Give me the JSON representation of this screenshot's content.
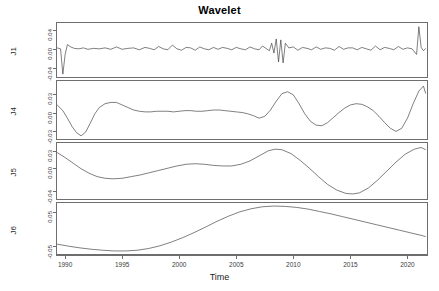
{
  "chart_data": {
    "type": "line",
    "title": "Wavelet",
    "xlabel": "Time",
    "ylabel": "",
    "grid": false,
    "legend": "none",
    "layout": "4 stacked panels sharing one time axis",
    "xlim": [
      1989.2,
      2021.8
    ],
    "xticks": [
      1990,
      1995,
      2000,
      2005,
      2010,
      2015,
      2020
    ],
    "xticklabels": [
      "1990",
      "1995",
      "2000",
      "2005",
      "2010",
      "2015",
      "2020"
    ],
    "panels": [
      {
        "name": "J1",
        "ylabel": "J1",
        "ylim": [
          -0.06,
          0.055
        ],
        "yticks": [
          -0.04,
          0.0,
          0.04
        ],
        "yticklabels": [
          "-0.04",
          "0.00",
          "0.04"
        ],
        "description": "High-frequency wavelet detail: near-zero noisy oscillation with a deep negative spike at the series start, a large oscillation burst near 2008-2009 and a tall positive spike at the end of 2021",
        "x": [
          1989.3,
          1989.6,
          1989.8,
          1990.0,
          1990.2,
          1990.5,
          1990.8,
          1991.2,
          1991.6,
          1992.0,
          1992.5,
          1993.0,
          1993.5,
          1994.0,
          1994.5,
          1995.0,
          1995.5,
          1996.0,
          1996.5,
          1997.0,
          1997.4,
          1997.8,
          1998.2,
          1998.6,
          1999.0,
          1999.4,
          1999.8,
          2000.2,
          2000.6,
          2001.0,
          2001.4,
          2001.8,
          2002.2,
          2002.6,
          2003.0,
          2003.4,
          2003.8,
          2004.2,
          2004.6,
          2005.0,
          2005.4,
          2005.8,
          2006.2,
          2006.6,
          2007.0,
          2007.3,
          2007.6,
          2007.9,
          2008.1,
          2008.3,
          2008.5,
          2008.7,
          2008.9,
          2009.1,
          2009.3,
          2009.6,
          2010.0,
          2010.4,
          2010.8,
          2011.2,
          2011.6,
          2012.0,
          2012.4,
          2012.8,
          2013.2,
          2013.6,
          2014.0,
          2014.4,
          2014.8,
          2015.2,
          2015.6,
          2016.0,
          2016.4,
          2016.8,
          2017.2,
          2017.6,
          2018.0,
          2018.4,
          2018.8,
          2019.2,
          2019.6,
          2020.0,
          2020.4,
          2020.8,
          2021.0,
          2021.2,
          2021.4,
          2021.6
        ],
        "y": [
          0.002,
          0.0,
          -0.054,
          -0.012,
          0.009,
          0.004,
          0.001,
          0.0,
          0.002,
          -0.001,
          0.001,
          0.0,
          0.002,
          -0.001,
          0.004,
          -0.001,
          0.001,
          0.002,
          -0.002,
          0.003,
          0.001,
          -0.002,
          0.005,
          0.0,
          -0.002,
          0.008,
          0.0,
          -0.003,
          0.003,
          0.002,
          -0.003,
          0.004,
          0.0,
          -0.002,
          0.003,
          -0.001,
          0.003,
          0.001,
          -0.002,
          0.003,
          0.0,
          -0.002,
          0.004,
          0.0,
          -0.002,
          0.006,
          0.001,
          -0.004,
          0.012,
          -0.009,
          0.021,
          -0.028,
          0.019,
          -0.03,
          0.012,
          0.002,
          0.004,
          -0.003,
          0.003,
          0.001,
          -0.002,
          0.004,
          -0.001,
          0.002,
          0.001,
          -0.003,
          0.005,
          -0.001,
          0.002,
          0.002,
          -0.002,
          0.003,
          0.0,
          -0.003,
          0.006,
          -0.002,
          0.003,
          0.001,
          -0.002,
          0.005,
          -0.001,
          0.002,
          0.0,
          -0.012,
          0.047,
          0.003,
          -0.004,
          0.001
        ]
      },
      {
        "name": "J4",
        "ylabel": "J4",
        "ylim": [
          -0.042,
          0.05
        ],
        "yticks": [
          -0.03,
          0.0,
          0.03
        ],
        "yticklabels": [
          "-0.03",
          "0.00",
          "0.03"
        ],
        "description": "Mid-frequency wavelet detail: starts elevated, plunges to a deep trough near 1991.5, recovers to a local peak near 1994.5, then a long mild wavy stretch, trough near 2007, strong peak near 2010, trough near 2012.5, moderate peak near 2016, deep trough near 2019 and a large peak near 2021",
        "x": [
          1989.3,
          1989.8,
          1990.2,
          1990.6,
          1991.0,
          1991.4,
          1991.8,
          1992.2,
          1992.6,
          1993.0,
          1993.5,
          1994.0,
          1994.5,
          1995.0,
          1995.5,
          1996.0,
          1996.5,
          1997.0,
          1997.5,
          1998.0,
          1998.5,
          1999.0,
          1999.5,
          2000.0,
          2000.5,
          2001.0,
          2001.5,
          2002.0,
          2002.5,
          2003.0,
          2003.5,
          2004.0,
          2004.5,
          2005.0,
          2005.5,
          2006.0,
          2006.5,
          2007.0,
          2007.5,
          2008.0,
          2008.5,
          2009.0,
          2009.5,
          2010.0,
          2010.5,
          2011.0,
          2011.5,
          2012.0,
          2012.5,
          2013.0,
          2013.5,
          2014.0,
          2014.5,
          2015.0,
          2015.5,
          2016.0,
          2016.5,
          2017.0,
          2017.5,
          2018.0,
          2018.5,
          2019.0,
          2019.5,
          2020.0,
          2020.5,
          2021.0,
          2021.4,
          2021.6
        ],
        "y": [
          0.012,
          0.003,
          -0.009,
          -0.022,
          -0.032,
          -0.037,
          -0.031,
          -0.017,
          -0.002,
          0.008,
          0.014,
          0.016,
          0.016,
          0.012,
          0.008,
          0.004,
          0.002,
          0.001,
          0.001,
          0.002,
          0.002,
          0.002,
          0.001,
          0.002,
          0.003,
          0.003,
          0.002,
          0.002,
          0.003,
          0.004,
          0.004,
          0.003,
          0.002,
          0.001,
          0.0,
          -0.002,
          -0.005,
          -0.009,
          -0.006,
          0.004,
          0.018,
          0.03,
          0.033,
          0.028,
          0.014,
          -0.002,
          -0.014,
          -0.02,
          -0.021,
          -0.016,
          -0.008,
          0.0,
          0.007,
          0.012,
          0.014,
          0.013,
          0.009,
          0.003,
          -0.006,
          -0.016,
          -0.025,
          -0.03,
          -0.025,
          -0.009,
          0.014,
          0.034,
          0.042,
          0.03
        ]
      },
      {
        "name": "J5",
        "ylabel": "J5",
        "ylim": [
          -0.055,
          0.045
        ],
        "yticks": [
          -0.04,
          0.0,
          0.03
        ],
        "yticklabels": [
          "-0.04",
          "0.00",
          "0.03"
        ],
        "description": "Lower-frequency wavelet detail: starts high, falls to a broad trough near 1994, rises to a peak near 2001, dips slightly near 2004, rises to a strong peak near 2008, falls to a deep trough near 2015 and climbs steeply to 2021",
        "x": [
          1989.3,
          1990.0,
          1990.7,
          1991.4,
          1992.1,
          1992.8,
          1993.5,
          1994.2,
          1995.0,
          1995.8,
          1996.6,
          1997.4,
          1998.2,
          1999.0,
          1999.8,
          2000.6,
          2001.4,
          2002.2,
          2003.0,
          2003.8,
          2004.6,
          2005.4,
          2006.2,
          2007.0,
          2007.8,
          2008.4,
          2009.0,
          2009.8,
          2010.6,
          2011.4,
          2012.2,
          2013.0,
          2013.8,
          2014.6,
          2015.2,
          2015.8,
          2016.6,
          2017.4,
          2018.2,
          2019.0,
          2019.8,
          2020.6,
          2021.2,
          2021.6
        ],
        "y": [
          0.028,
          0.019,
          0.009,
          -0.001,
          -0.009,
          -0.015,
          -0.018,
          -0.019,
          -0.018,
          -0.015,
          -0.012,
          -0.008,
          -0.004,
          0.0,
          0.004,
          0.007,
          0.008,
          0.007,
          0.005,
          0.004,
          0.004,
          0.007,
          0.013,
          0.022,
          0.031,
          0.034,
          0.033,
          0.026,
          0.014,
          0.0,
          -0.015,
          -0.029,
          -0.039,
          -0.045,
          -0.046,
          -0.044,
          -0.035,
          -0.021,
          -0.005,
          0.011,
          0.025,
          0.034,
          0.037,
          0.033
        ]
      },
      {
        "name": "J6",
        "ylabel": "J6",
        "ylim": [
          -0.075,
          0.075
        ],
        "yticks": [
          -0.05,
          0.05
        ],
        "yticklabels": [
          "-0.05",
          "0.05"
        ],
        "description": "Smoothest wavelet component: a single slow cycle starting moderately low, a shallow minimum around 1994-1996, a long rise to a broad maximum near 2008-2010, then a steady decline through 2021",
        "x": [
          1989.3,
          1990.3,
          1991.3,
          1992.3,
          1993.3,
          1994.3,
          1995.3,
          1996.3,
          1997.3,
          1998.3,
          1999.3,
          2000.3,
          2001.3,
          2002.3,
          2003.3,
          2004.3,
          2005.3,
          2006.3,
          2007.3,
          2008.3,
          2009.3,
          2010.3,
          2011.3,
          2012.3,
          2013.3,
          2014.3,
          2015.3,
          2016.3,
          2017.3,
          2018.3,
          2019.3,
          2020.3,
          2021.3,
          2021.6
        ],
        "y": [
          -0.046,
          -0.052,
          -0.057,
          -0.061,
          -0.064,
          -0.066,
          -0.066,
          -0.064,
          -0.059,
          -0.051,
          -0.04,
          -0.027,
          -0.012,
          0.004,
          0.021,
          0.036,
          0.049,
          0.058,
          0.064,
          0.066,
          0.065,
          0.062,
          0.057,
          0.05,
          0.043,
          0.035,
          0.027,
          0.019,
          0.011,
          0.003,
          -0.005,
          -0.013,
          -0.021,
          -0.024
        ]
      }
    ]
  }
}
